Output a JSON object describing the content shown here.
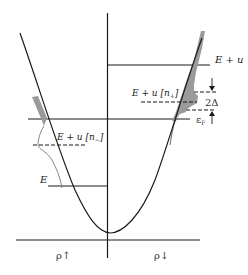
{
  "diagram": {
    "type": "band-structure-spin-split-parabola",
    "colors": {
      "line": "#1a1a1a",
      "thin_curve": "#777777",
      "shade": "#9a9a9a",
      "background": "#ffffff"
    },
    "labels": {
      "e_plus_u": "E + u",
      "e_plus_u_n_plus": "E + u [n",
      "n_plus_sub": "+",
      "n_plus_close": "]",
      "e_plus_u_n_minus": "E + u [n",
      "n_minus_sub": "−",
      "n_minus_close": "]",
      "two_delta": "2Δ",
      "fermi": "ε",
      "fermi_sub": "F",
      "e": "E",
      "rho_up": "ρ↑",
      "rho_down": "ρ↓"
    },
    "levels": [
      {
        "name": "E + u",
        "side": "right",
        "style": "solid"
      },
      {
        "name": "E + u[n+]",
        "side": "right",
        "style": "dashed"
      },
      {
        "name": "2Δ upper",
        "side": "right",
        "style": "dashed"
      },
      {
        "name": "2Δ lower",
        "side": "right",
        "style": "dashed"
      },
      {
        "name": "εF",
        "side": "both",
        "style": "solid"
      },
      {
        "name": "E + u[n−]",
        "side": "left",
        "style": "dashed"
      },
      {
        "name": "E",
        "side": "left",
        "style": "solid"
      }
    ],
    "axes": {
      "left_label": "ρ↑",
      "right_label": "ρ↓"
    }
  }
}
